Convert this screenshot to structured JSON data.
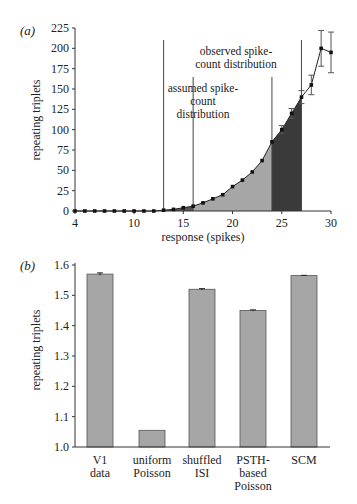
{
  "chart_data": [
    {
      "panel_label": "(a)",
      "type": "line",
      "xlabel": "response (spikes)",
      "ylabel": "repeating triplets",
      "xlim": [
        4,
        30
      ],
      "ylim": [
        0,
        225
      ],
      "x_ticks": [
        "4",
        "10",
        "15",
        "20",
        "25",
        "30"
      ],
      "y_ticks": [
        "0",
        "25",
        "50",
        "75",
        "100",
        "125",
        "150",
        "175",
        "200",
        "225"
      ],
      "x": [
        4,
        5,
        6,
        7,
        8,
        9,
        10,
        11,
        12,
        13,
        14,
        15,
        16,
        17,
        18,
        19,
        20,
        21,
        22,
        23,
        24,
        25,
        26,
        27,
        28,
        29,
        30
      ],
      "values": [
        0,
        0,
        0,
        0,
        0,
        0,
        0,
        0,
        0,
        1,
        2,
        4,
        6,
        10,
        15,
        20,
        30,
        38,
        48,
        62,
        85,
        100,
        120,
        140,
        155,
        200,
        195
      ],
      "error_bars": [
        0,
        0,
        0,
        0,
        0,
        0,
        0,
        0,
        0,
        0,
        0,
        0,
        0,
        0,
        0,
        0,
        0,
        0,
        0,
        0,
        0,
        5,
        6,
        8,
        12,
        22,
        25
      ],
      "shaded_regions": [
        {
          "from": 13,
          "to": 16,
          "color": "#555555"
        },
        {
          "from": 16,
          "to": 24,
          "color": "#a6a6a6"
        },
        {
          "from": 24,
          "to": 27,
          "color": "#3a3a3a"
        }
      ],
      "vertical_lines": [
        13,
        16,
        24,
        27
      ],
      "annotations": [
        {
          "text": "observed spike-count distribution",
          "spans": [
            13,
            27
          ]
        },
        {
          "text": "assumed spike-count distribution",
          "spans": [
            16,
            24
          ]
        }
      ],
      "grid": false
    },
    {
      "panel_label": "(b)",
      "type": "bar",
      "xlabel": "",
      "ylabel": "repeating triplets",
      "ylim": [
        1.0,
        1.6
      ],
      "y_ticks": [
        "1.0",
        "1.1",
        "1.2",
        "1.3",
        "1.4",
        "1.5",
        "1.6"
      ],
      "categories": [
        "V1 data",
        "uniform Poisson",
        "shuffled ISI",
        "PSTH-based Poisson",
        "SCM"
      ],
      "values": [
        1.57,
        1.055,
        1.52,
        1.45,
        1.565
      ],
      "error_bars": [
        0.004,
        0,
        0.002,
        0.002,
        0.001
      ],
      "bar_color": "#a6a6a6",
      "grid": false
    }
  ],
  "panel_a": {
    "label": "(a)",
    "ylabel": "repeating triplets",
    "xlabel": "response (spikes)",
    "annotation_observed_1": "observed spike-",
    "annotation_observed_2": "count distribution",
    "annotation_assumed_1": "assumed spike-",
    "annotation_assumed_2": "count",
    "annotation_assumed_3": "distribution",
    "y_ticks": [
      "0",
      "25",
      "50",
      "75",
      "100",
      "125",
      "150",
      "175",
      "200",
      "225"
    ],
    "x_ticks": [
      "4",
      "10",
      "15",
      "20",
      "25",
      "30"
    ]
  },
  "panel_b": {
    "label": "(b)",
    "ylabel": "repeating triplets",
    "y_ticks": [
      "1.0",
      "1.1",
      "1.2",
      "1.3",
      "1.4",
      "1.5",
      "1.6"
    ],
    "cat_labels": [
      [
        "V1",
        "data"
      ],
      [
        "uniform",
        "Poisson"
      ],
      [
        "shuffled",
        "ISI"
      ],
      [
        "PSTH-",
        "based",
        "Poisson"
      ],
      [
        "SCM"
      ]
    ]
  }
}
